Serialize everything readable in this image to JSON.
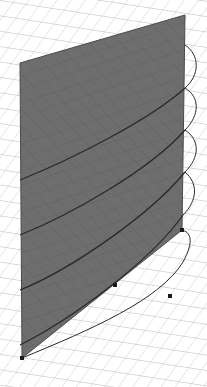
{
  "scene": {
    "description": "3D view of a helix curve wrapping around a vertical axis with a shaded planar section",
    "colors": {
      "background": "#ffffff",
      "grid": "#c8c8c8",
      "plane_fill": "#6e6e6e",
      "plane_grid": "#5a5a5a",
      "curve": "#2a2a2a",
      "point": "#1a1a1a"
    },
    "plane": {
      "polygon": [
        [
          20,
          63
        ],
        [
          185,
          15
        ],
        [
          182,
          230
        ],
        [
          22,
          358
        ]
      ]
    },
    "helix_turns": [
      {
        "front": "M20,180 C70,160 150,120 185,88",
        "back": "M185,88 C200,75 200,55 185,45"
      },
      {
        "front": "M20,235 C70,215 150,170 185,130",
        "back": "M185,130 C200,115 200,97 185,88"
      },
      {
        "front": "M20,290 C70,270 150,215 185,172",
        "back": "M185,172 C200,157 200,140 185,130"
      },
      {
        "front": "M20,345 C70,320 150,262 183,215",
        "back": "M183,215 C198,200 198,183 185,172"
      }
    ],
    "points": [
      {
        "name": "point-a",
        "x": 182,
        "y": 230
      },
      {
        "name": "point-b",
        "x": 115,
        "y": 285
      },
      {
        "name": "point-c",
        "x": 170,
        "y": 296
      },
      {
        "name": "point-d",
        "x": 22,
        "y": 358
      }
    ]
  }
}
